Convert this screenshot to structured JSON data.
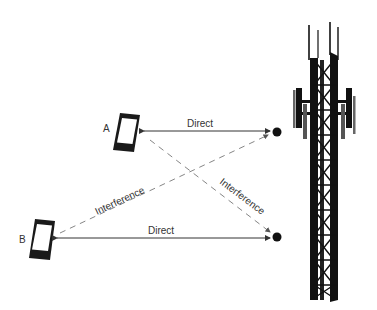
{
  "diagram": {
    "nodes": {
      "phone_a": {
        "label": "A"
      },
      "phone_b": {
        "label": "B"
      }
    },
    "edges": {
      "a_direct": {
        "label": "Direct",
        "style": "solid"
      },
      "b_direct": {
        "label": "Direct",
        "style": "solid"
      },
      "b_interference": {
        "label": "Interference",
        "style": "dashed"
      },
      "a_interference": {
        "label": "Interference",
        "style": "dashed"
      }
    },
    "colors": {
      "line": "#333333",
      "dashed": "#888888",
      "tower": "#111111"
    }
  }
}
